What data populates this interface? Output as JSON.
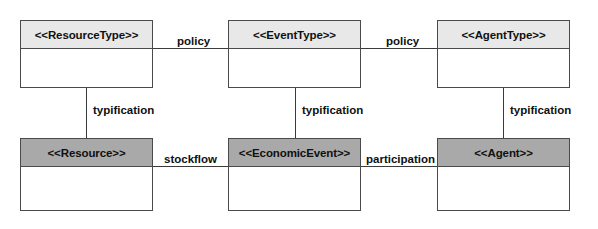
{
  "diagram": {
    "type": "uml-class-diagram",
    "colors": {
      "header_light": "#e8e8e8",
      "header_dark": "#a9a9a9",
      "border": "#4a4a4a",
      "line": "#3a3a3a",
      "background": "#ffffff",
      "text": "#101010"
    },
    "nodes": [
      {
        "id": "resource-type",
        "label": "<<ResourceType>>",
        "row": "top",
        "column": "left",
        "header_shade": "light"
      },
      {
        "id": "event-type",
        "label": "<<EventType>>",
        "row": "top",
        "column": "center",
        "header_shade": "light"
      },
      {
        "id": "agent-type",
        "label": "<<AgentType>>",
        "row": "top",
        "column": "right",
        "header_shade": "light"
      },
      {
        "id": "resource",
        "label": "<<Resource>>",
        "row": "bottom",
        "column": "left",
        "header_shade": "dark"
      },
      {
        "id": "economic-event",
        "label": "<<EconomicEvent>>",
        "row": "bottom",
        "column": "center",
        "header_shade": "dark"
      },
      {
        "id": "agent",
        "label": "<<Agent>>",
        "row": "bottom",
        "column": "right",
        "header_shade": "dark"
      }
    ],
    "edges": [
      {
        "id": "policy-left",
        "label": "policy",
        "orientation": "horizontal",
        "from": "resource-type",
        "to": "event-type"
      },
      {
        "id": "policy-right",
        "label": "policy",
        "orientation": "horizontal",
        "from": "event-type",
        "to": "agent-type"
      },
      {
        "id": "typification-left",
        "label": "typification",
        "orientation": "vertical",
        "from": "resource-type",
        "to": "resource"
      },
      {
        "id": "typification-center",
        "label": "typification",
        "orientation": "vertical",
        "from": "event-type",
        "to": "economic-event"
      },
      {
        "id": "typification-right",
        "label": "typification",
        "orientation": "vertical",
        "from": "agent-type",
        "to": "agent"
      },
      {
        "id": "stockflow",
        "label": "stockflow",
        "orientation": "horizontal",
        "from": "resource",
        "to": "economic-event"
      },
      {
        "id": "participation",
        "label": "participation",
        "orientation": "horizontal",
        "from": "economic-event",
        "to": "agent"
      }
    ]
  }
}
